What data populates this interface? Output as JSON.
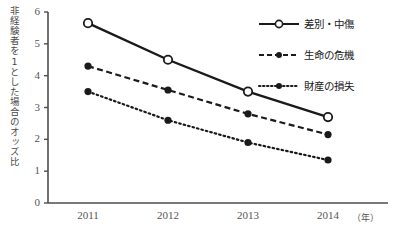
{
  "chart_data": {
    "type": "line",
    "title": "",
    "xlabel": "",
    "ylabel": "非経験者を1とした場合のオッズ比",
    "x_unit": "（年）",
    "categories": [
      "2011",
      "2012",
      "2013",
      "2014"
    ],
    "ylim": [
      0,
      6
    ],
    "yticks": [
      "0",
      "1",
      "2",
      "3",
      "4",
      "5",
      "6"
    ],
    "grid": false,
    "legend_position": "right-top",
    "series": [
      {
        "name": "差別・中傷",
        "values": [
          5.65,
          4.5,
          3.5,
          2.7
        ],
        "line_style": "solid",
        "marker": "open-circle",
        "color": "#1a1a1a"
      },
      {
        "name": "生命の危機",
        "values": [
          4.3,
          3.55,
          2.8,
          2.15
        ],
        "line_style": "dashed",
        "marker": "filled-circle",
        "color": "#1a1a1a"
      },
      {
        "name": "財産の損失",
        "values": [
          3.5,
          2.6,
          1.9,
          1.35
        ],
        "line_style": "dotted",
        "marker": "filled-circle",
        "color": "#1a1a1a"
      }
    ]
  },
  "axis": {
    "color": "#4d4d4d"
  }
}
